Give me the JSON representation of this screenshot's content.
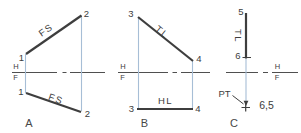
{
  "colors": {
    "ink": "#3e3e3e",
    "ground": "#4f4f4f",
    "projector": "#a7bed6",
    "text": "#3d3d3d"
  },
  "panel_a": {
    "caption": "A",
    "hf_top": "H",
    "hf_bottom": "F",
    "upper_line": "FS",
    "lower_line": "FS",
    "upper_p1": "1",
    "upper_p2": "2",
    "lower_p1": "1",
    "lower_p2": "2"
  },
  "panel_b": {
    "caption": "B",
    "hf_top": "H",
    "hf_bottom": "F",
    "upper_line": "TL",
    "lower_line": "HL",
    "upper_p3": "3",
    "upper_p4": "4",
    "lower_p3": "3",
    "lower_p4": "4"
  },
  "panel_c": {
    "caption": "C",
    "hf_top": "H",
    "hf_bottom": "F",
    "line_label": "TL",
    "p5": "5",
    "p6": "6",
    "point_tag": "PT",
    "distance": "6,5"
  }
}
